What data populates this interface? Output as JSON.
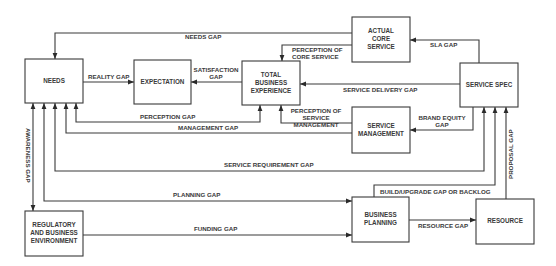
{
  "diagram": {
    "nodes": {
      "needs": {
        "label": [
          "NEEDS"
        ]
      },
      "expectation": {
        "label": [
          "EXPECTATION"
        ]
      },
      "total_business_experience": {
        "label": [
          "TOTAL",
          "BUSINESS",
          "EXPERIENCE"
        ]
      },
      "actual_core_service": {
        "label": [
          "ACTUAL",
          "CORE",
          "SERVICE"
        ]
      },
      "service_spec": {
        "label": [
          "SERVICE SPEC"
        ]
      },
      "service_management": {
        "label": [
          "SERVICE",
          "MANAGEMENT"
        ]
      },
      "regulatory_business_environment": {
        "label": [
          "REGULATORY",
          "AND BUSINESS",
          "ENVIRONMENT"
        ]
      },
      "business_planning": {
        "label": [
          "BUSINESS",
          "PLANNING"
        ]
      },
      "resource": {
        "label": [
          "RESOURCE"
        ]
      }
    },
    "edges": {
      "needs_gap": {
        "label": [
          "NEEDS GAP"
        ],
        "from": "actual_core_service",
        "to": "needs"
      },
      "reality_gap": {
        "label": [
          "REALITY GAP"
        ],
        "from": "needs",
        "to": "expectation"
      },
      "satisfaction_gap": {
        "label": [
          "SATISFACTION",
          "GAP"
        ],
        "from": "total_business_experience",
        "to": "expectation"
      },
      "perception_of_core_service": {
        "label": [
          "PERCEPTION OF",
          "CORE SERVICE"
        ],
        "from": "actual_core_service",
        "to": "total_business_experience"
      },
      "sla_gap": {
        "label": [
          "SLA GAP"
        ],
        "from": "service_spec",
        "to": "actual_core_service"
      },
      "service_delivery_gap": {
        "label": [
          "SERVICE DELIVERY GAP"
        ],
        "from": "service_spec",
        "to": "total_business_experience"
      },
      "brand_equity_gap": {
        "label": [
          "BRAND EQUITY",
          "GAP"
        ],
        "from": "service_spec",
        "to": "service_management"
      },
      "perception_of_service_management": {
        "label": [
          "PERCEPTION OF",
          "SERVICE",
          "MANAGEMENT"
        ],
        "from": "service_management",
        "to": "total_business_experience"
      },
      "perception_gap": {
        "label": [
          "PERCEPTION GAP"
        ],
        "from": "needs",
        "to": "total_business_experience"
      },
      "management_gap": {
        "label": [
          "MANAGEMENT GAP"
        ],
        "from": "service_management",
        "to": "needs"
      },
      "service_requirement_gap": {
        "label": [
          "SERVICE REQUIREMENT GAP"
        ],
        "from": "needs",
        "to": "service_spec"
      },
      "planning_gap": {
        "label": [
          "PLANNING GAP"
        ],
        "from": "needs",
        "to": "business_planning"
      },
      "awareness_gap": {
        "label": [
          "AWARENESS GAP"
        ],
        "from": "needs",
        "to": "regulatory_business_environment"
      },
      "funding_gap": {
        "label": [
          "FUNDING GAP"
        ],
        "from": "regulatory_business_environment",
        "to": "business_planning"
      },
      "build_upgrade_gap": {
        "label": [
          "BUILD/UPGRADE GAP OR BACKLOG"
        ],
        "from": "business_planning",
        "to": "service_spec"
      },
      "resource_gap": {
        "label": [
          "RESOURCE GAP"
        ],
        "from": "business_planning",
        "to": "resource"
      },
      "proposal_gap": {
        "label": [
          "PROPOSAL GAP"
        ],
        "from": "resource",
        "to": "service_spec"
      }
    }
  }
}
